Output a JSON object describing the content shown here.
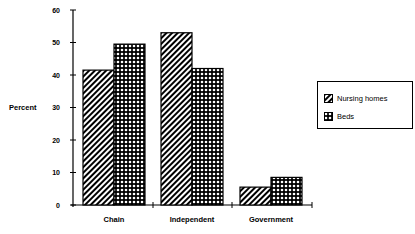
{
  "chart_data": {
    "type": "bar",
    "title": "",
    "xlabel": "",
    "ylabel": "Percent",
    "ylim": [
      0,
      60
    ],
    "yticks": [
      0,
      10,
      20,
      30,
      40,
      50,
      60
    ],
    "grid": false,
    "legend_position": "right",
    "categories": [
      "Chain",
      "Independent",
      "Government"
    ],
    "series": [
      {
        "name": "Nursing homes",
        "pattern": "diagonal-hatch",
        "values": [
          41.5,
          53,
          5.5
        ]
      },
      {
        "name": "Beds",
        "pattern": "crosshatch",
        "values": [
          49.5,
          42,
          8.5
        ]
      }
    ]
  },
  "axis": {
    "y_title": "Percent",
    "ticks": [
      "0",
      "10",
      "20",
      "30",
      "40",
      "50",
      "60"
    ]
  },
  "categories": [
    "Chain",
    "Independent",
    "Government"
  ],
  "legend": {
    "items": [
      {
        "label": "Nursing homes",
        "icon": "diagonal-hatch-swatch"
      },
      {
        "label": "Beds",
        "icon": "crosshatch-swatch"
      }
    ]
  }
}
